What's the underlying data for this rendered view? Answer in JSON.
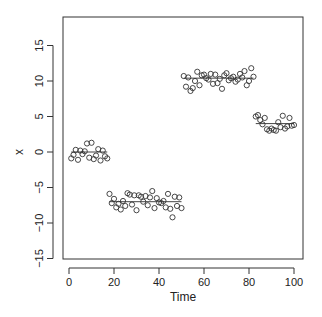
{
  "chart_data": {
    "type": "scatter",
    "title": "",
    "xlabel": "Time",
    "ylabel": "x",
    "xlim": [
      -4,
      104
    ],
    "ylim": [
      -15.5,
      19
    ],
    "xticks": [
      0,
      20,
      40,
      60,
      80,
      100
    ],
    "yticks": [
      -15,
      -10,
      -5,
      0,
      5,
      10,
      15
    ],
    "grid": false,
    "legend": null,
    "marker": "open-circle",
    "segments": [
      {
        "start": 1,
        "end": 17,
        "mean": 0.0
      },
      {
        "start": 18,
        "end": 50,
        "mean": -7.0
      },
      {
        "start": 51,
        "end": 82,
        "mean": 10.4
      },
      {
        "start": 83,
        "end": 100,
        "mean": 4.0
      }
    ],
    "x": [
      1,
      2,
      3,
      4,
      5,
      6,
      7,
      8,
      9,
      10,
      11,
      12,
      13,
      14,
      15,
      16,
      17,
      18,
      19,
      20,
      21,
      22,
      23,
      24,
      25,
      26,
      27,
      28,
      29,
      30,
      31,
      32,
      33,
      34,
      35,
      36,
      37,
      38,
      39,
      40,
      41,
      42,
      43,
      44,
      45,
      46,
      47,
      48,
      49,
      50,
      51,
      52,
      53,
      54,
      55,
      56,
      57,
      58,
      59,
      60,
      61,
      62,
      63,
      64,
      65,
      66,
      67,
      68,
      69,
      70,
      71,
      72,
      73,
      74,
      75,
      76,
      77,
      78,
      79,
      80,
      81,
      82,
      83,
      84,
      85,
      86,
      87,
      88,
      89,
      90,
      91,
      92,
      93,
      94,
      95,
      96,
      97,
      98,
      99,
      100
    ],
    "y": [
      -0.9,
      -0.4,
      0.3,
      -1.1,
      0.2,
      -0.3,
      0.1,
      1.2,
      -0.8,
      1.3,
      -1.0,
      -0.5,
      0.4,
      -1.2,
      0.2,
      -0.6,
      -0.9,
      -5.9,
      -7.2,
      -6.6,
      -7.8,
      -7.3,
      -8.1,
      -6.9,
      -7.6,
      -5.8,
      -6.0,
      -7.4,
      -6.1,
      -8.2,
      -6.1,
      -6.3,
      -7.0,
      -6.2,
      -7.5,
      -6.4,
      -5.5,
      -7.9,
      -6.5,
      -7.1,
      -7.2,
      -6.9,
      -7.8,
      -5.9,
      -8.0,
      -9.2,
      -6.3,
      -7.6,
      -6.4,
      -7.9,
      10.7,
      9.2,
      10.5,
      8.6,
      9.0,
      10.0,
      11.3,
      9.4,
      10.8,
      10.9,
      10.4,
      10.2,
      11.0,
      9.6,
      10.9,
      9.7,
      10.3,
      8.9,
      10.8,
      11.1,
      10.1,
      10.4,
      10.6,
      9.9,
      10.2,
      11.0,
      10.5,
      11.4,
      9.4,
      10.0,
      11.8,
      10.6,
      5.0,
      5.2,
      4.5,
      3.9,
      4.8,
      3.2,
      3.0,
      3.3,
      3.1,
      3.0,
      4.2,
      3.5,
      5.1,
      3.3,
      3.6,
      4.8,
      3.7,
      3.8
    ]
  }
}
